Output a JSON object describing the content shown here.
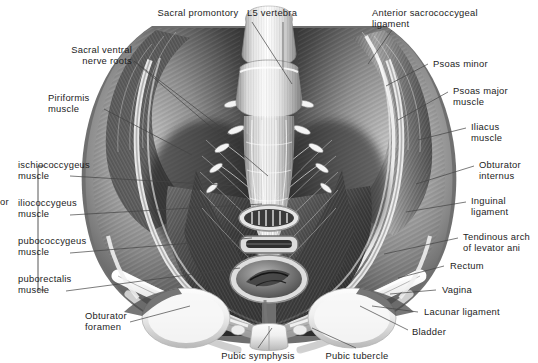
{
  "figure": {
    "style": "grayscale anatomical illustration",
    "background_color": "#ffffff",
    "text_color": "#1d1d1d",
    "leader_line_color": "#444444"
  },
  "labels": {
    "sacral_promontory": "Sacral promontory",
    "l5_vertebra": "L5 vertebra",
    "anterior_sacrococcygeal_ligament": "Anterior sacrococcygeal\nligament",
    "sacral_ventral_nerve_roots": "Sacral ventral\nnerve roots",
    "piriformis_muscle": "Piriformis\nmuscle",
    "psoas_minor": "Psoas minor",
    "psoas_major_muscle": "Psoas major\nmuscle",
    "iliacus_muscle": "Iliacus\nmuscle",
    "obturator_internus": "Obturator\ninternus",
    "inguinal_ligament": "Inguinal\nligament",
    "tendinous_arch_of_levator_ani": "Tendinous arch\nof levator ani",
    "rectum": "Rectum",
    "vagina": "Vagina",
    "lacunar_ligament": "Lacunar ligament",
    "bladder": "Bladder",
    "pubic_tubercle": "Pubic tubercle",
    "pubic_symphysis": "Pubic symphysis",
    "obturator_foramen": "Obturator\nforamen",
    "ischiococcygeus_muscle": "ischiococcygeus\nmuscle",
    "iliococcygeus_muscle": "iliococcygeus\nmuscle",
    "pubococcygeus_muscle": "pubococcygeus\nmuscle",
    "puborectalis_muscle": "puborectalis\nmuscle",
    "levator_ani_group_cropped": "or"
  }
}
